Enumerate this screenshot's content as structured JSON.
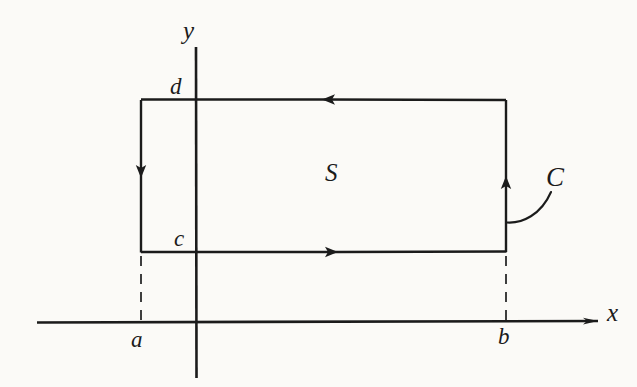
{
  "figure": {
    "kind": "green-theorem-rectangle-diagram",
    "background_color": "#fbfaf7",
    "ink_color": "#1b1b1b",
    "width": 637,
    "height": 387
  },
  "axes": {
    "x_axis": {
      "label": "x",
      "label_x": 607,
      "label_y": 300,
      "y": 322,
      "x_start": 37,
      "x_end": 600,
      "has_arrow": true
    },
    "y_axis": {
      "label": "y",
      "label_x": 183,
      "label_y": 18,
      "x": 196,
      "y_start": 47,
      "y_end": 378,
      "has_arrow": false
    }
  },
  "rectangle": {
    "name": "region-boundary-rectangle",
    "left": 141,
    "right": 506,
    "top": 100,
    "bottom": 252,
    "orientation": "clockwise",
    "edges": [
      {
        "name": "top-edge",
        "direction": "left",
        "arrow_at": 322
      },
      {
        "name": "right-edge",
        "direction": "up",
        "arrow_at": 175
      },
      {
        "name": "bottom-edge",
        "direction": "right",
        "arrow_at": 338
      },
      {
        "name": "left-edge",
        "direction": "down",
        "arrow_at": 175
      }
    ]
  },
  "dashed_guides": [
    {
      "name": "guide-a",
      "x": 141,
      "y_top": 256,
      "y_bottom": 320
    },
    {
      "name": "guide-b",
      "x": 506,
      "y_top": 256,
      "y_bottom": 320
    }
  ],
  "labels": {
    "region": {
      "text": "S",
      "x": 325,
      "y": 160
    },
    "curve": {
      "text": "C",
      "x": 546,
      "y": 164
    },
    "bound_a": {
      "text": "a",
      "x": 131,
      "y": 328
    },
    "bound_b": {
      "text": "b",
      "x": 498,
      "y": 325
    },
    "bound_c": {
      "text": "c",
      "x": 174,
      "y": 227
    },
    "bound_d": {
      "text": "d",
      "x": 170,
      "y": 75
    }
  },
  "leader": {
    "name": "curve-leader-line",
    "from_x": 507,
    "from_y": 222,
    "to_x": 551,
    "to_y": 192
  }
}
